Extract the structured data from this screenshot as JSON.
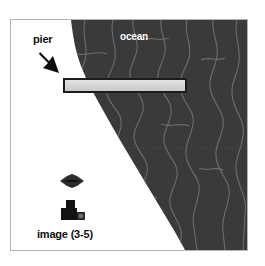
{
  "figure": {
    "background_color": "#ffffff",
    "frame_color": "#b4b4b4",
    "width": 265,
    "height": 266
  },
  "map": {
    "ocean": {
      "label": "ocean",
      "fill_color": "#3a3a3a",
      "label_color": "#ffffff",
      "contour_color": "#6e6e6e"
    },
    "land": {
      "fill_color": "#ffffff"
    },
    "pier": {
      "label": "pier",
      "fill_color": "#d8d8d8",
      "outline_color": "#1c1c1c"
    },
    "image_marker": {
      "label": "image (3-5)",
      "color": "#111111"
    },
    "icons": {
      "arrow": "arrow-down-right-icon",
      "boat": "boat-icon",
      "camera": "camera-icon"
    }
  }
}
